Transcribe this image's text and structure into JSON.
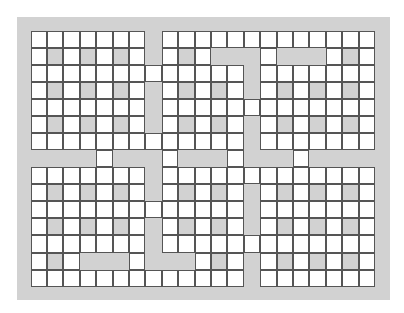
{
  "board": {
    "cols": 21,
    "rows": 15,
    "legend": {
      "W": "white cell",
      "G": "shaded cell",
      "X": "channel gap"
    },
    "colors": {
      "white": "#ffffff",
      "shade": "#d2d2d2",
      "line": "#555555"
    },
    "cells": [
      "WWWWWWWXWWWWWWWWWWWWW",
      "WGWGWGWXWGWXXXWXXXWGW",
      "WWWWWWWWWWWWWXWWWWWWW",
      "WGWGWGWXWGWGWXWGWGWGW",
      "WWWWWWWXWWWWWWWWWWWWW",
      "WGWGWGWXWGWGWXWGWGWGW",
      "WWWWWWWWWWWWWXWWWWWWW",
      "XXXXWXXXWXXXWXXXWXXXX",
      "WWWWWWWXWWWWWWWWWWWWW",
      "WGWGWGWXWGWGWXWGWGWGW",
      "WWWWWWWWWWWWWXWWWWWWW",
      "WGWGWGWXWGWGWXWGWGWGW",
      "WWWWWWWXWWWWWWWWWWWWW",
      "WGWXXXWXXXWGWXWGWGWGW",
      "WWWWWWWWWWWWWXWWWWWWW"
    ]
  }
}
